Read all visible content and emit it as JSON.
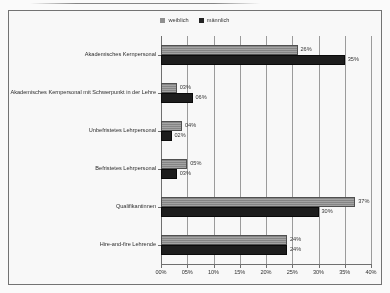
{
  "figure": {
    "legend": {
      "position": "top-center",
      "items": [
        {
          "label": "weiblich",
          "color": "#8d8d8d",
          "swatch_name": "legend-swatch-weiblich"
        },
        {
          "label": "männlich",
          "color": "#141414",
          "swatch_name": "legend-swatch-maennlich"
        }
      ]
    }
  },
  "chart_data": {
    "type": "bar",
    "orientation": "horizontal",
    "title": "",
    "subtitle": "",
    "xlabel": "",
    "ylabel": "",
    "xlim": [
      0,
      40
    ],
    "grid": true,
    "legend_position": "top-center",
    "categories": [
      "Akademisches Kernpersonal",
      "Akademisches Kernpersonal mit Schwerpunkt in der Lehre",
      "Unbefristetes Lehrpersonal",
      "Befristetes Lehrpersonal",
      "Qualifikantinnen",
      "Hire-and-fire Lehrende"
    ],
    "series": [
      {
        "name": "weiblich",
        "color": "#8d8d8d",
        "values": [
          26,
          3,
          4,
          5,
          37,
          24
        ],
        "labels": [
          "26%",
          "03%",
          "04%",
          "05%",
          "37%",
          "24%"
        ]
      },
      {
        "name": "männlich",
        "color": "#141414",
        "values": [
          35,
          6,
          2,
          3,
          30,
          24
        ],
        "labels": [
          "35%",
          "06%",
          "02%",
          "03%",
          "30%",
          "24%"
        ]
      }
    ],
    "xticks": [
      0,
      5,
      10,
      15,
      20,
      25,
      30,
      35,
      40
    ],
    "xticklabels": [
      "00%",
      "05%",
      "10%",
      "15%",
      "20%",
      "25%",
      "30%",
      "35%",
      "40%"
    ]
  }
}
